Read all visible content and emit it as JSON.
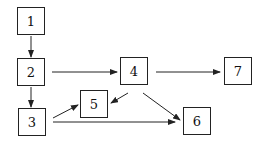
{
  "diagram": {
    "type": "flow-graph",
    "nodes": [
      {
        "id": "1",
        "label": "1",
        "x": 17,
        "y": 7
      },
      {
        "id": "2",
        "label": "2",
        "x": 17,
        "y": 58
      },
      {
        "id": "3",
        "label": "3",
        "x": 18,
        "y": 108
      },
      {
        "id": "4",
        "label": "4",
        "x": 120,
        "y": 57
      },
      {
        "id": "5",
        "label": "5",
        "x": 80,
        "y": 90
      },
      {
        "id": "6",
        "label": "6",
        "x": 183,
        "y": 107
      },
      {
        "id": "7",
        "label": "7",
        "x": 224,
        "y": 57
      }
    ],
    "edges": [
      {
        "from": "1",
        "to": "2"
      },
      {
        "from": "2",
        "to": "3"
      },
      {
        "from": "2",
        "to": "4"
      },
      {
        "from": "4",
        "to": "7"
      },
      {
        "from": "4",
        "to": "5"
      },
      {
        "from": "4",
        "to": "6"
      },
      {
        "from": "3",
        "to": "5"
      },
      {
        "from": "3",
        "to": "6"
      }
    ],
    "colors": {
      "stroke": "#222222",
      "background": "#ffffff"
    }
  }
}
